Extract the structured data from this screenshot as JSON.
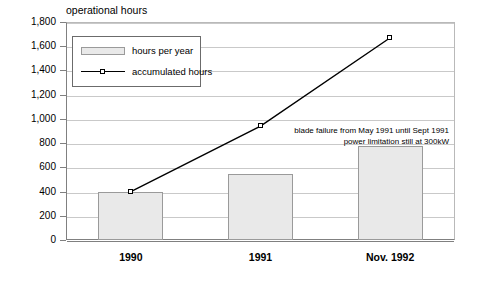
{
  "chart_data": {
    "type": "bar",
    "title": "operational hours",
    "xlabel": "",
    "ylabel": "",
    "categories": [
      "1990",
      "1991",
      "Nov. 1992"
    ],
    "ylim": [
      0,
      1800
    ],
    "ytick_step": 200,
    "ytick_labels": [
      "0",
      "200",
      "400",
      "600",
      "800",
      "1,000",
      "1,200",
      "1,400",
      "1,600",
      "1,800"
    ],
    "grid": true,
    "legend_position": "top-left-inside",
    "series": [
      {
        "name": "hours per year",
        "type": "bar",
        "values": [
          400,
          545,
          780
        ],
        "fill_color": "#e9e9e9",
        "border_color": "#9a9a9a"
      },
      {
        "name": "accumulated hours",
        "type": "line",
        "values": [
          400,
          940,
          1670
        ],
        "line_color": "#000000",
        "marker": "square",
        "marker_fill": "#ffffff"
      }
    ],
    "annotations": [
      {
        "lines": [
          "blade failure from May 1991 until Sept 1991",
          "power limitation still at 300kW"
        ],
        "align": "right"
      }
    ]
  }
}
